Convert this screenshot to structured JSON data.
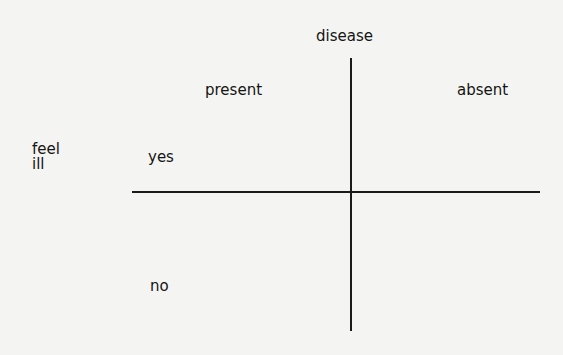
{
  "diagram": {
    "column_variable": "disease",
    "columns": [
      "present",
      "absent"
    ],
    "row_variable": "feel\nill",
    "rows": [
      "yes",
      "no"
    ]
  }
}
